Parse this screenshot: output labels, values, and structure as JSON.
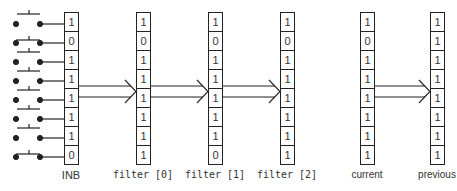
{
  "diagram": {
    "title": "",
    "switches": [
      {
        "row": 0,
        "state": "open"
      },
      {
        "row": 1,
        "state": "closed"
      },
      {
        "row": 2,
        "state": "open"
      },
      {
        "row": 3,
        "state": "open"
      },
      {
        "row": 4,
        "state": "open"
      },
      {
        "row": 5,
        "state": "open"
      },
      {
        "row": 6,
        "state": "open"
      },
      {
        "row": 7,
        "state": "closed"
      }
    ],
    "columns": [
      {
        "label": "INB",
        "bits": [
          "1",
          "0",
          "1",
          "1",
          "1",
          "1",
          "1",
          "0"
        ]
      },
      {
        "label": "filter [0]",
        "bits": [
          "1",
          "0",
          "1",
          "1",
          "1",
          "1",
          "1",
          "1"
        ]
      },
      {
        "label": "filter [1]",
        "bits": [
          "1",
          "0",
          "1",
          "1",
          "1",
          "1",
          "1",
          "0"
        ]
      },
      {
        "label": "filter [2]",
        "bits": [
          "1",
          "0",
          "1",
          "1",
          "1",
          "1",
          "1",
          "1"
        ]
      },
      {
        "label": "current",
        "bits": [
          "1",
          "0",
          "1",
          "1",
          "1",
          "1",
          "1",
          "1"
        ]
      },
      {
        "label": "previous",
        "bits": [
          "1",
          "1",
          "1",
          "1",
          "1",
          "1",
          "1",
          "1"
        ]
      }
    ],
    "arrows": [
      {
        "from": "INB",
        "to": "filter [0]"
      },
      {
        "from": "filter [0]",
        "to": "filter [1]"
      },
      {
        "from": "filter [1]",
        "to": "filter [2]"
      },
      {
        "from": "current",
        "to": "previous"
      }
    ],
    "colors": {
      "stroke": "#222222",
      "text": "#333333",
      "background": "#ffffff"
    }
  }
}
